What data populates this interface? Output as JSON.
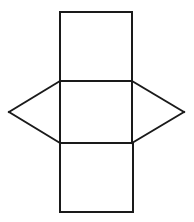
{
  "figure": {
    "kind": "geometric-net",
    "canvas": {
      "width": 194,
      "height": 222
    },
    "background_color": "#FFFFFF",
    "stroke_color": "#1A1A1A",
    "stroke_width": 2,
    "fill_color": "#FFFFFF",
    "parts": [
      {
        "name": "top-square",
        "shape": "square",
        "points": "60,12 132,12 132,81 60,81",
        "label": "Top square"
      },
      {
        "name": "middle-square",
        "shape": "square",
        "points": "60,81 132,81 132,143 60,143",
        "label": "Middle square"
      },
      {
        "name": "bottom-square",
        "shape": "square",
        "points": "60,143 133,143 133,212 60,212",
        "label": "Bottom square"
      },
      {
        "name": "left-triangle",
        "shape": "triangle",
        "points": "60,81 9,112 60,143",
        "label": "Left triangle"
      },
      {
        "name": "right-triangle",
        "shape": "triangle",
        "points": "132,81 184,112 132,143",
        "label": "Right triangle"
      }
    ],
    "edges": [
      {
        "name": "top-square-top-edge",
        "d": "M 60 12 L 132 12"
      },
      {
        "name": "top-square-left-edge",
        "d": "M 60 12 L 60 81"
      },
      {
        "name": "top-square-right-edge",
        "d": "M 132 12 L 132 81"
      },
      {
        "name": "middle-square-top-edge",
        "d": "M 60 81 L 132 81"
      },
      {
        "name": "middle-square-left-edge",
        "d": "M 60 81 L 60 143"
      },
      {
        "name": "middle-square-right-edge",
        "d": "M 132 81 L 132 143"
      },
      {
        "name": "middle-square-bottom-edge",
        "d": "M 60 143 L 132 143"
      },
      {
        "name": "bottom-square-left-edge",
        "d": "M 60 143 L 60 212"
      },
      {
        "name": "bottom-square-right-edge",
        "d": "M 133 143 L 133 212"
      },
      {
        "name": "bottom-square-bottom-edge",
        "d": "M 60 212 L 133 212"
      },
      {
        "name": "left-triangle-upper-edge",
        "d": "M 60 81 L 9 112"
      },
      {
        "name": "left-triangle-lower-edge",
        "d": "M 9 112 L 60 143"
      },
      {
        "name": "right-triangle-upper-edge",
        "d": "M 132 81 L 184 112"
      },
      {
        "name": "right-triangle-lower-edge",
        "d": "M 184 112 L 132 143"
      }
    ],
    "vertices": [
      {
        "name": "top-square-top-left",
        "x": 60,
        "y": 12
      },
      {
        "name": "top-square-top-right",
        "x": 132,
        "y": 12
      },
      {
        "name": "middle-square-top-left",
        "x": 60,
        "y": 81
      },
      {
        "name": "middle-square-top-right",
        "x": 132,
        "y": 81
      },
      {
        "name": "middle-square-bottom-left",
        "x": 60,
        "y": 143
      },
      {
        "name": "middle-square-bottom-right",
        "x": 132,
        "y": 143
      },
      {
        "name": "bottom-square-bottom-left",
        "x": 60,
        "y": 212
      },
      {
        "name": "bottom-square-bottom-right",
        "x": 133,
        "y": 212
      },
      {
        "name": "left-triangle-apex",
        "x": 9,
        "y": 112
      },
      {
        "name": "right-triangle-apex",
        "x": 184,
        "y": 112
      }
    ]
  }
}
